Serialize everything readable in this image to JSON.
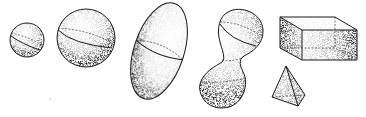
{
  "figure": {
    "description": "Stippled line drawings of 3D solids",
    "background": "#ffffff",
    "ink": "#1a1a1a",
    "shapes": [
      {
        "name": "small-sphere",
        "label": "Small sphere",
        "cx": 27,
        "cy": 40,
        "r": 17
      },
      {
        "name": "large-sphere",
        "label": "Large sphere",
        "cx": 86,
        "cy": 38,
        "r": 29
      },
      {
        "name": "ellipsoid",
        "label": "Tilted ellipsoid",
        "cx": 159,
        "cy": 51,
        "rx": 25,
        "ry": 50,
        "rotate": 18
      },
      {
        "name": "peanut",
        "label": "Peanut / dumbbell shape",
        "top": {
          "cx": 241,
          "cy": 31,
          "r": 22
        },
        "bottom": {
          "cx": 222,
          "cy": 85,
          "r": 23
        }
      },
      {
        "name": "box",
        "label": "Rectangular prism"
      },
      {
        "name": "pyramid",
        "label": "Tetrahedron / pyramid"
      }
    ]
  }
}
